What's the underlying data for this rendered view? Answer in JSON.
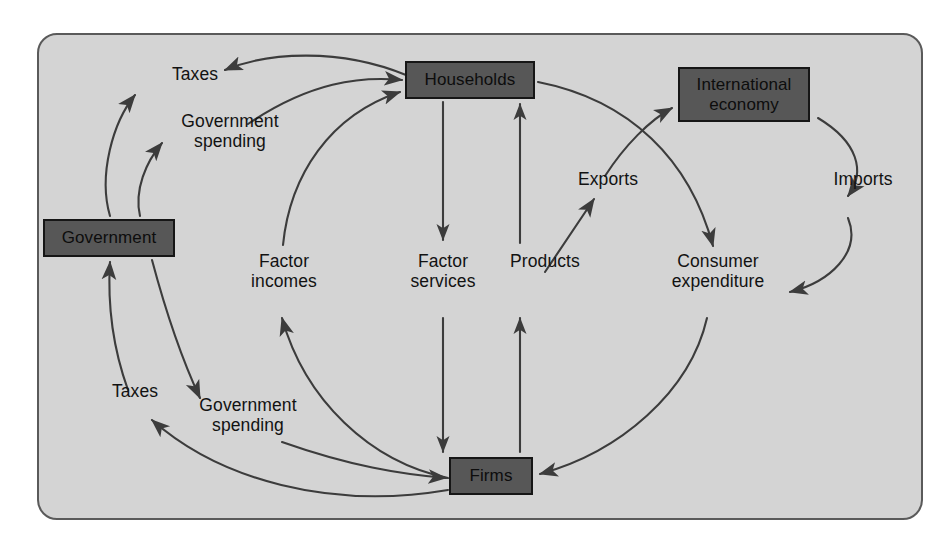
{
  "diagram": {
    "frame": {
      "background_color": "#d4d4d4",
      "border_color": "#5a5a5a"
    },
    "colors": {
      "node_fill": "#575757",
      "node_border": "#161616",
      "arrow": "#3c3c3c",
      "text": "#121212"
    },
    "nodes": [
      {
        "id": "government",
        "label": "Government"
      },
      {
        "id": "households",
        "label": "Households"
      },
      {
        "id": "international-economy",
        "label": "International\neconomy"
      },
      {
        "id": "firms",
        "label": "Firms"
      }
    ],
    "flow_labels": [
      {
        "id": "taxes-top",
        "text": "Taxes"
      },
      {
        "id": "government-spending-top",
        "text": "Government\nspending"
      },
      {
        "id": "factor-incomes",
        "text": "Factor\nincomes"
      },
      {
        "id": "factor-services",
        "text": "Factor\nservices"
      },
      {
        "id": "products",
        "text": "Products"
      },
      {
        "id": "exports",
        "text": "Exports"
      },
      {
        "id": "imports",
        "text": "Imports"
      },
      {
        "id": "consumer-expenditure",
        "text": "Consumer\nexpenditure"
      },
      {
        "id": "taxes-bottom",
        "text": "Taxes"
      },
      {
        "id": "government-spending-bottom",
        "text": "Government\nspending"
      }
    ],
    "flows": [
      {
        "id": "households-to-government-taxes",
        "from": "households",
        "to": "government",
        "label": "Taxes"
      },
      {
        "id": "government-to-households-spending",
        "from": "government",
        "to": "households",
        "label": "Government spending"
      },
      {
        "id": "firms-to-households-factor-incomes",
        "from": "firms",
        "to": "households",
        "label": "Factor incomes"
      },
      {
        "id": "households-to-firms-factor-services",
        "from": "households",
        "to": "firms",
        "label": "Factor services"
      },
      {
        "id": "firms-to-households-products",
        "from": "firms",
        "to": "households",
        "label": "Products"
      },
      {
        "id": "firms-to-international-exports",
        "from": "firms",
        "to": "international-economy",
        "label": "Exports"
      },
      {
        "id": "international-to-consumer-imports",
        "from": "international-economy",
        "to": "firms",
        "label": "Imports"
      },
      {
        "id": "households-to-firms-consumer-expenditure",
        "from": "households",
        "to": "firms",
        "label": "Consumer expenditure"
      },
      {
        "id": "firms-to-government-taxes",
        "from": "firms",
        "to": "government",
        "label": "Taxes"
      },
      {
        "id": "government-to-firms-spending",
        "from": "government",
        "to": "firms",
        "label": "Government spending"
      }
    ]
  }
}
